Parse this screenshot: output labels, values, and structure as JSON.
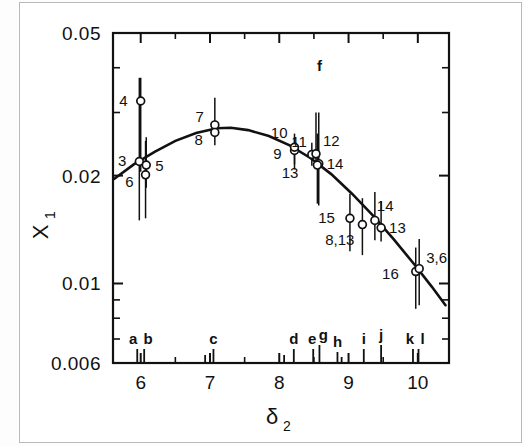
{
  "figure": {
    "background": "#ffffff",
    "frame_color": "#111111",
    "curve_color": "#111111",
    "marker_color": "#111111",
    "errorbar_color": "#111111"
  },
  "chart_data": {
    "type": "scatter",
    "title": "",
    "subtitle": "",
    "xlabel": "δ",
    "xlabel_sub": "2",
    "ylabel": "X",
    "ylabel_sub": "1",
    "xscale": "linear",
    "yscale": "log",
    "xlim": [
      5.6,
      10.45
    ],
    "ylim": [
      0.006,
      0.05
    ],
    "grid": false,
    "legend": "none",
    "xticks": [
      6,
      7,
      8,
      9,
      10
    ],
    "xtick_labels": [
      "6",
      "7",
      "8",
      "9",
      "10"
    ],
    "xminor_ticks": [
      6.5,
      7.5,
      8.5,
      9.5
    ],
    "yticks": [
      0.05,
      0.02,
      0.01,
      0.006
    ],
    "ytick_labels": [
      "0.05",
      "0.02",
      "0.01",
      "0.006"
    ],
    "yminor_ticks": [
      0.04,
      0.03,
      0.009,
      0.008,
      0.007
    ],
    "points": [
      {
        "label": "4",
        "x": 6.0,
        "y": 0.0323,
        "yerr_low": 0.0205,
        "yerr_high": 0.0375,
        "lab_dx": -13,
        "lab_dy": 5
      },
      {
        "label": "3",
        "x": 5.98,
        "y": 0.0219,
        "yerr_low": 0.015,
        "yerr_high": 0.0375,
        "lab_dx": -13,
        "lab_dy": 5
      },
      {
        "label": "5",
        "x": 6.08,
        "y": 0.0214,
        "yerr_low": 0.0185,
        "yerr_high": 0.0256,
        "lab_dx": 9,
        "lab_dy": 6
      },
      {
        "label": "6",
        "x": 6.07,
        "y": 0.0201,
        "yerr_low": 0.0152,
        "yerr_high": 0.025,
        "lab_dx": -12,
        "lab_dy": 12
      },
      {
        "label": "7",
        "x": 7.07,
        "y": 0.0277,
        "yerr_low": 0.0258,
        "yerr_high": 0.033,
        "lab_dx": -11,
        "lab_dy": -3
      },
      {
        "label": "8",
        "x": 7.07,
        "y": 0.0264,
        "yerr_low": 0.0243,
        "yerr_high": 0.0282,
        "lab_dx": -12,
        "lab_dy": 13
      },
      {
        "label": "9",
        "x": 8.22,
        "y": 0.0235,
        "yerr_low": 0.0208,
        "yerr_high": 0.0256,
        "lab_dx": -13,
        "lab_dy": 8
      },
      {
        "label": "10",
        "x": 8.22,
        "y": 0.024,
        "yerr_low": 0.0215,
        "yerr_high": 0.0262,
        "lab_dx": -7,
        "lab_dy": -9
      },
      {
        "label": "11",
        "x": 8.47,
        "y": 0.0229,
        "yerr_low": 0.0213,
        "yerr_high": 0.0247,
        "lab_dx": -5,
        "lab_dy": -8
      },
      {
        "label": "12",
        "x": 8.53,
        "y": 0.023,
        "yerr_low": 0.0212,
        "yerr_high": 0.03,
        "lab_dx": 7,
        "lab_dy": -8
      },
      {
        "label": "14",
        "x": 8.57,
        "y": 0.0216,
        "yerr_low": 0.0165,
        "yerr_high": 0.03,
        "lab_dx": 8,
        "lab_dy": 5
      },
      {
        "label": "13",
        "x": 8.55,
        "y": 0.0214,
        "yerr_low": 0.0167,
        "yerr_high": 0.0262,
        "lab_dx": -19,
        "lab_dy": 13
      },
      {
        "label": "15",
        "x": 9.02,
        "y": 0.0152,
        "yerr_low": 0.0123,
        "yerr_high": 0.0178,
        "lab_dx": -15,
        "lab_dy": 5
      },
      {
        "label": "8,13",
        "x": 9.2,
        "y": 0.0146,
        "yerr_low": 0.012,
        "yerr_high": 0.0173,
        "lab_dx": -8,
        "lab_dy": 20
      },
      {
        "label": "14",
        "x": 9.38,
        "y": 0.015,
        "yerr_low": 0.0132,
        "yerr_high": 0.018,
        "lab_dx": 2,
        "lab_dy": -9
      },
      {
        "label": "13",
        "x": 9.47,
        "y": 0.0143,
        "yerr_low": 0.0131,
        "yerr_high": 0.017,
        "lab_dx": 8,
        "lab_dy": 5
      },
      {
        "label": "16",
        "x": 9.97,
        "y": 0.0108,
        "yerr_low": 0.0085,
        "yerr_high": 0.0126,
        "lab_dx": -17,
        "lab_dy": 7
      },
      {
        "label": "3,6",
        "x": 10.02,
        "y": 0.011,
        "yerr_low": 0.0087,
        "yerr_high": 0.0133,
        "lab_dx": 7,
        "lab_dy": -6
      }
    ],
    "curve": [
      {
        "x": 5.62,
        "y": 0.0196
      },
      {
        "x": 5.9,
        "y": 0.0215
      },
      {
        "x": 6.2,
        "y": 0.0233
      },
      {
        "x": 6.5,
        "y": 0.025
      },
      {
        "x": 6.8,
        "y": 0.0263
      },
      {
        "x": 7.1,
        "y": 0.0271
      },
      {
        "x": 7.3,
        "y": 0.0272
      },
      {
        "x": 7.55,
        "y": 0.0268
      },
      {
        "x": 7.85,
        "y": 0.0258
      },
      {
        "x": 8.15,
        "y": 0.0243
      },
      {
        "x": 8.45,
        "y": 0.0224
      },
      {
        "x": 8.75,
        "y": 0.0202
      },
      {
        "x": 9.05,
        "y": 0.0178
      },
      {
        "x": 9.35,
        "y": 0.0155
      },
      {
        "x": 9.65,
        "y": 0.0133
      },
      {
        "x": 9.95,
        "y": 0.0113
      },
      {
        "x": 10.2,
        "y": 0.0098
      },
      {
        "x": 10.4,
        "y": 0.0087
      }
    ],
    "axis_letter_marks": [
      {
        "label": "a",
        "x": 5.95,
        "tick_len": 14,
        "lab_dx": -4
      },
      {
        "label": "b",
        "x": 6.05,
        "tick_len": 14,
        "lab_dx": 4
      },
      {
        "label": "c",
        "x": 7.05,
        "tick_len": 14,
        "lab_dx": 0
      },
      {
        "label": "",
        "x": 6.93,
        "tick_len": 8,
        "lab_dx": 0
      },
      {
        "label": "d",
        "x": 8.21,
        "tick_len": 14,
        "lab_dx": 0
      },
      {
        "label": "",
        "x": 8.07,
        "tick_len": 8,
        "lab_dx": 0
      },
      {
        "label": "e",
        "x": 8.49,
        "tick_len": 14,
        "lab_dx": -1
      },
      {
        "label": "g",
        "x": 8.58,
        "tick_len": 18,
        "lab_dx": 4
      },
      {
        "label": "h",
        "x": 8.84,
        "tick_len": 11,
        "lab_dx": 0
      },
      {
        "label": "",
        "x": 8.9,
        "tick_len": 6,
        "lab_dx": 0
      },
      {
        "label": "i",
        "x": 9.22,
        "tick_len": 14,
        "lab_dx": 0
      },
      {
        "label": "j",
        "x": 9.47,
        "tick_len": 18,
        "lab_dx": 0
      },
      {
        "label": "k",
        "x": 9.93,
        "tick_len": 14,
        "lab_dx": -3
      },
      {
        "label": "l",
        "x": 10.01,
        "tick_len": 14,
        "lab_dx": 4
      }
    ],
    "top_annotation": {
      "label": "f",
      "x": 8.58,
      "y_tick": true
    }
  }
}
